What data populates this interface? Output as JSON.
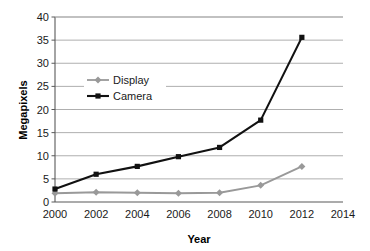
{
  "chart_data": {
    "type": "line",
    "title": "",
    "xlabel": "Year",
    "ylabel": "Megapixels",
    "x": [
      2000,
      2002,
      2004,
      2006,
      2008,
      2010,
      2012
    ],
    "xticks": [
      "2000",
      "2002",
      "2004",
      "2006",
      "2008",
      "2010",
      "2012",
      "2014"
    ],
    "xtick_values": [
      2000,
      2002,
      2004,
      2006,
      2008,
      2010,
      2012,
      2014
    ],
    "yticks": [
      "0",
      "5",
      "10",
      "15",
      "20",
      "25",
      "30",
      "35",
      "40"
    ],
    "ytick_values": [
      0,
      5,
      10,
      15,
      20,
      25,
      30,
      35,
      40
    ],
    "xlim": [
      2000,
      2014
    ],
    "ylim": [
      0,
      40
    ],
    "grid": "horizontal",
    "legend_position": "upper-left-inside",
    "series": [
      {
        "name": "Display",
        "color": "#999999",
        "marker": "diamond",
        "values": [
          1.9,
          2.1,
          2.0,
          1.9,
          2.0,
          3.6,
          7.7
        ]
      },
      {
        "name": "Camera",
        "color": "#111111",
        "marker": "square",
        "values": [
          2.8,
          6.0,
          7.7,
          9.8,
          11.8,
          17.7,
          35.6
        ]
      }
    ]
  },
  "legend": {
    "items": [
      {
        "label": "Display"
      },
      {
        "label": "Camera"
      }
    ]
  },
  "axes": {
    "x_title": "Year",
    "y_title": "Megapixels"
  },
  "colors": {
    "display_series": "#999999",
    "camera_series": "#111111",
    "gridline": "#a6a6a6",
    "axis": "#595959",
    "background": "#ffffff"
  }
}
